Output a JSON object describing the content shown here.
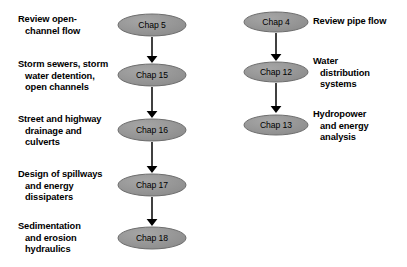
{
  "diagram": {
    "colors": {
      "node_fill": "#8c8c8c",
      "node_fill_light": "#a6a6a6",
      "node_stroke": "#6e6e6e",
      "arrow": "#000000",
      "text": "#000000",
      "background": "#ffffff"
    },
    "branches": [
      {
        "name": "open-channel-flow-branch",
        "label_side": "left",
        "node_center_x": 152,
        "text_x": 18,
        "nodes": [
          {
            "id": "chap-5",
            "node_label": "Chap 5",
            "cy": 25,
            "rx": 34,
            "ry": 11,
            "text_lines": [
              "Review open-",
              "channel flow"
            ],
            "text_indent": [
              false,
              true
            ],
            "text_y": 14
          },
          {
            "id": "chap-15",
            "node_label": "Chap 15",
            "cy": 75,
            "rx": 34,
            "ry": 11,
            "text_lines": [
              "Storm sewers, storm",
              "water detention,",
              "open channels"
            ],
            "text_indent": [
              false,
              true,
              true
            ],
            "text_y": 59
          },
          {
            "id": "chap-16",
            "node_label": "Chap 16",
            "cy": 130,
            "rx": 34,
            "ry": 11,
            "text_lines": [
              "Street and highway",
              "drainage and",
              "culverts"
            ],
            "text_indent": [
              false,
              true,
              true
            ],
            "text_y": 114
          },
          {
            "id": "chap-17",
            "node_label": "Chap 17",
            "cy": 185,
            "rx": 34,
            "ry": 11,
            "text_lines": [
              "Design of spillways",
              "and energy",
              "dissipaters"
            ],
            "text_indent": [
              false,
              true,
              true
            ],
            "text_y": 169
          },
          {
            "id": "chap-18",
            "node_label": "Chap 18",
            "cy": 238,
            "rx": 34,
            "ry": 11,
            "text_lines": [
              "Sedimentation",
              "and erosion",
              "hydraulics"
            ],
            "text_indent": [
              false,
              true,
              true
            ],
            "text_y": 221
          }
        ],
        "arrows": [
          {
            "x": 152,
            "y1": 37,
            "y2": 63
          },
          {
            "x": 152,
            "y1": 87,
            "y2": 118
          },
          {
            "x": 152,
            "y1": 142,
            "y2": 173
          },
          {
            "x": 152,
            "y1": 197,
            "y2": 226
          }
        ]
      },
      {
        "name": "pipe-flow-branch",
        "label_side": "right",
        "node_center_x": 276,
        "text_x": 313,
        "nodes": [
          {
            "id": "chap-4",
            "node_label": "Chap 4",
            "cy": 22,
            "rx": 32,
            "ry": 10,
            "text_lines": [
              "Review pipe flow"
            ],
            "text_indent": [
              false
            ],
            "text_y": 16
          },
          {
            "id": "chap-12",
            "node_label": "Chap 12",
            "cy": 72,
            "rx": 32,
            "ry": 10,
            "text_lines": [
              "Water",
              "distribution",
              "systems"
            ],
            "text_indent": [
              false,
              true,
              true
            ],
            "text_y": 56
          },
          {
            "id": "chap-13",
            "node_label": "Chap 13",
            "cy": 125,
            "rx": 32,
            "ry": 10,
            "text_lines": [
              "Hydropower",
              "and energy",
              "analysis"
            ],
            "text_indent": [
              false,
              true,
              true
            ],
            "text_y": 109
          }
        ],
        "arrows": [
          {
            "x": 276,
            "y1": 33,
            "y2": 61
          },
          {
            "x": 276,
            "y1": 83,
            "y2": 113
          }
        ]
      }
    ]
  }
}
